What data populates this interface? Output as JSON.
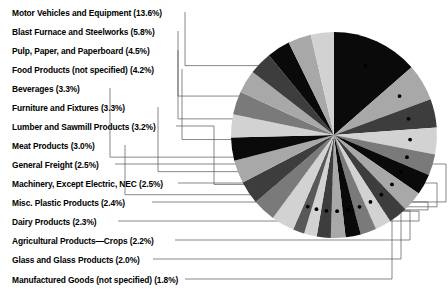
{
  "chart_data": {
    "type": "pie",
    "title": "",
    "subtitle": "",
    "xlabel": "",
    "ylabel": "",
    "legend_position": "left-outside-with-leader-lines",
    "grid": false,
    "units": "percent",
    "total_labeled_percent": 56.4,
    "categories": [
      "Motor Vehicles and Equipment",
      "Blast Furnace and Steelworks",
      "Pulp, Paper, and Paperboard",
      "Food Products (not specified)",
      "Beverages",
      "Furniture and Fixtures",
      "Lumber and Sawmill Products",
      "Meat Products",
      "General Freight",
      "Machinery, Except Electric, NEC",
      "Misc. Plastic Products",
      "Dairy Products",
      "Agricultural Products—Crops",
      "Glass and Glass Products",
      "Manufactured Goods (not specified)"
    ],
    "values": [
      13.6,
      5.8,
      4.5,
      4.2,
      3.3,
      3.3,
      3.2,
      3.0,
      2.5,
      2.5,
      2.4,
      2.3,
      2.2,
      2.0,
      1.8
    ],
    "value_labels": [
      "13.6%",
      "5.8%",
      "4.5%",
      "4.2%",
      "3.3%",
      "3.3%",
      "3.2%",
      "3.0%",
      "2.5%",
      "2.5%",
      "2.4%",
      "2.3%",
      "2.2%",
      "2.0%",
      "1.8%"
    ],
    "slice_colors": [
      "#0a0a0a",
      "#a8a8a8",
      "#3d3d3d",
      "#d2d2d2",
      "#7a7a7a",
      "#0a0a0a",
      "#a8a8a8",
      "#3d3d3d",
      "#d2d2d2",
      "#7a7a7a",
      "#0a0a0a",
      "#a8a8a8",
      "#3d3d3d",
      "#d2d2d2",
      "#585858"
    ],
    "remainder": {
      "label": "",
      "value": 43.6,
      "color": "#bdbdbd"
    }
  },
  "legend": {
    "items": [
      {
        "label": "Motor Vehicles and Equipment (13.6%)"
      },
      {
        "label": "Blast Furnace and Steelworks (5.8%)"
      },
      {
        "label": "Pulp, Paper, and Paperboard (4.5%)"
      },
      {
        "label": "Food Products (not specified) (4.2%)"
      },
      {
        "label": "Beverages (3.3%)"
      },
      {
        "label": "Furniture and Fixtures (3.3%)"
      },
      {
        "label": "Lumber and Sawmill Products (3.2%)"
      },
      {
        "label": "Meat Products (3.0%)"
      },
      {
        "label": "General Freight (2.5%)"
      },
      {
        "label": "Machinery, Except Electric, NEC (2.5%)"
      },
      {
        "label": "Misc. Plastic Products (2.4%)"
      },
      {
        "label": "Dairy Products (2.3%)"
      },
      {
        "label": "Agricultural Products—Crops (2.2%)"
      },
      {
        "label": "Glass and Glass Products (2.0%)"
      },
      {
        "label": "Manufactured Goods (not specified) (1.8%)"
      }
    ]
  },
  "colors": {
    "black": "#0a0a0a",
    "dark_gray": "#3d3d3d",
    "mid_gray": "#7a7a7a",
    "light_gray": "#a8a8a8",
    "pale_gray": "#d2d2d2",
    "leader_line": "#555555",
    "background": "#ffffff",
    "text": "#000000"
  }
}
